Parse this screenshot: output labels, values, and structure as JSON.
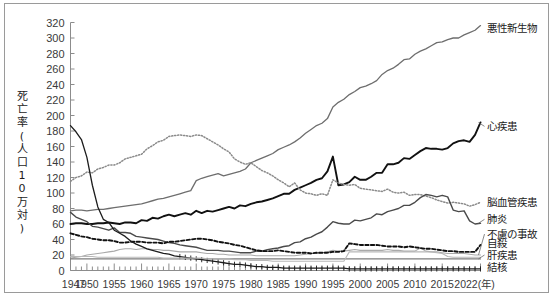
{
  "figure": {
    "y_axis_title": "死亡率(人口10万対)",
    "y_axis_title_chars": [
      "死",
      "亡",
      "率",
      "(",
      "人",
      "口",
      "1",
      "0",
      "万",
      "対",
      ")"
    ],
    "x_axis_unit_label": "2022(年)"
  },
  "chart_data": {
    "type": "line",
    "title": "",
    "xlabel": "年",
    "ylabel": "死亡率(人口10万対)",
    "xlim": [
      1947,
      2022
    ],
    "ylim": [
      0,
      320
    ],
    "ytick_step": 20,
    "grid": false,
    "legend_position": "right-inline-labels",
    "yticks": [
      0,
      20,
      40,
      60,
      80,
      100,
      120,
      140,
      160,
      180,
      200,
      220,
      240,
      260,
      280,
      300,
      320
    ],
    "xticks": [
      1947,
      1950,
      1955,
      1960,
      1965,
      1970,
      1975,
      1980,
      1985,
      1990,
      1995,
      2000,
      2005,
      2010,
      2015,
      2022
    ],
    "xtick_labels": [
      "1947",
      "1950",
      "1955",
      "1960",
      "1965",
      "1970",
      "1975",
      "1980",
      "1985",
      "1990",
      "1995",
      "2000",
      "2005",
      "2010",
      "2015",
      "2022(年)"
    ],
    "x": [
      1947,
      1948,
      1949,
      1950,
      1951,
      1952,
      1953,
      1954,
      1955,
      1956,
      1957,
      1958,
      1959,
      1960,
      1961,
      1962,
      1963,
      1964,
      1965,
      1966,
      1967,
      1968,
      1969,
      1970,
      1971,
      1972,
      1973,
      1974,
      1975,
      1976,
      1977,
      1978,
      1979,
      1980,
      1981,
      1982,
      1983,
      1984,
      1985,
      1986,
      1987,
      1988,
      1989,
      1990,
      1991,
      1992,
      1993,
      1994,
      1995,
      1996,
      1997,
      1998,
      1999,
      2000,
      2001,
      2002,
      2003,
      2004,
      2005,
      2006,
      2007,
      2008,
      2009,
      2010,
      2011,
      2012,
      2013,
      2014,
      2015,
      2016,
      2017,
      2018,
      2019,
      2020,
      2021,
      2022
    ],
    "series": [
      {
        "name": "悪性新生物",
        "label": "悪性新生物",
        "color": "#6e6e6e",
        "style": "solid",
        "width": 1.3,
        "label_xy": [
          2022,
          313
        ],
        "values": [
          77,
          78,
          78,
          77,
          78,
          79,
          79,
          80,
          81,
          82,
          83,
          84,
          85,
          86,
          88,
          90,
          92,
          93,
          95,
          97,
          99,
          101,
          103,
          116,
          119,
          121,
          123,
          125,
          122,
          124,
          126,
          128,
          131,
          139,
          142,
          145,
          148,
          151,
          156,
          159,
          162,
          166,
          171,
          177,
          182,
          187,
          190,
          196,
          211,
          217,
          221,
          227,
          231,
          236,
          238,
          241,
          245,
          253,
          258,
          261,
          266,
          272,
          273,
          279,
          283,
          286,
          290,
          294,
          295,
          298,
          300,
          300,
          304,
          307,
          310,
          316
        ]
      },
      {
        "name": "心疾患",
        "label": "心疾患",
        "color": "#111111",
        "style": "solid",
        "width": 1.9,
        "label_xy": [
          2022,
          186
        ],
        "values": [
          60,
          61,
          61,
          60,
          60,
          61,
          61,
          62,
          61,
          60,
          62,
          62,
          61,
          65,
          64,
          68,
          67,
          70,
          72,
          70,
          72,
          74,
          72,
          77,
          74,
          77,
          76,
          78,
          80,
          82,
          80,
          84,
          83,
          86,
          88,
          89,
          91,
          93,
          96,
          99,
          99,
          104,
          107,
          110,
          113,
          117,
          119,
          128,
          147,
          110,
          111,
          114,
          121,
          117,
          117,
          121,
          126,
          126,
          137,
          137,
          139,
          145,
          144,
          149,
          154,
          158,
          157,
          157,
          156,
          158,
          164,
          167,
          168,
          166,
          175,
          191
        ]
      },
      {
        "name": "脳血管疾患",
        "label": "脳血管疾患",
        "color": "#8a8a8a",
        "style": "dotted",
        "width": 1.5,
        "label_xy": [
          2022,
          88
        ],
        "values": [
          115,
          120,
          122,
          127,
          126,
          131,
          133,
          136,
          136,
          139,
          144,
          146,
          148,
          150,
          157,
          161,
          166,
          168,
          173,
          174,
          175,
          174,
          173,
          175,
          174,
          170,
          166,
          162,
          157,
          153,
          144,
          140,
          137,
          139,
          134,
          129,
          126,
          122,
          117,
          113,
          108,
          113,
          104,
          100,
          99,
          97,
          99,
          97,
          117,
          113,
          111,
          110,
          111,
          106,
          105,
          104,
          103,
          102,
          105,
          101,
          100,
          101,
          97,
          98,
          98,
          96,
          94,
          91,
          89,
          87,
          88,
          87,
          86,
          83,
          85,
          88
        ]
      },
      {
        "name": "肺炎",
        "label": "肺炎",
        "color": "#4a4a4a",
        "style": "solid",
        "width": 1.4,
        "label_xy": [
          2022,
          66
        ],
        "values": [
          75,
          69,
          66,
          63,
          57,
          56,
          54,
          52,
          55,
          49,
          49,
          48,
          44,
          43,
          42,
          41,
          40,
          38,
          36,
          35,
          33,
          32,
          31,
          30,
          28,
          26,
          26,
          26,
          25,
          25,
          24,
          23,
          23,
          23,
          25,
          25,
          27,
          28,
          29,
          31,
          32,
          36,
          37,
          41,
          43,
          47,
          50,
          56,
          63,
          61,
          60,
          60,
          65,
          64,
          66,
          68,
          73,
          72,
          76,
          78,
          80,
          84,
          84,
          88,
          94,
          98,
          97,
          95,
          97,
          95,
          78,
          76,
          77,
          64,
          60,
          61
        ]
      },
      {
        "name": "不慮の事故",
        "label": "不慮の事故",
        "color": "#a9a9a9",
        "style": "solid",
        "width": 1.1,
        "label_xy": [
          2022,
          47
        ],
        "values": [
          16,
          17,
          18,
          20,
          21,
          22,
          23,
          24,
          25,
          27,
          28,
          28,
          27,
          28,
          28,
          27,
          27,
          26,
          26,
          25,
          24,
          24,
          24,
          24,
          23,
          22,
          22,
          21,
          21,
          20,
          20,
          20,
          20,
          20,
          19,
          19,
          19,
          19,
          19,
          19,
          19,
          19,
          20,
          21,
          22,
          22,
          23,
          24,
          26,
          25,
          25,
          26,
          27,
          26,
          26,
          26,
          26,
          26,
          27,
          26,
          26,
          25,
          25,
          25,
          29,
          25,
          24,
          24,
          23,
          22,
          22,
          22,
          22,
          21,
          20,
          20
        ]
      },
      {
        "name": "自殺",
        "label": "自殺",
        "color": "#111111",
        "style": "dashed",
        "width": 1.9,
        "label_xy": [
          2022,
          35
        ],
        "values": [
          48,
          46,
          44,
          43,
          41,
          40,
          39,
          39,
          38,
          36,
          36,
          37,
          37,
          37,
          36,
          36,
          36,
          35,
          37,
          37,
          38,
          39,
          40,
          41,
          41,
          40,
          39,
          37,
          36,
          35,
          33,
          32,
          30,
          28,
          26,
          25,
          25,
          25,
          26,
          25,
          24,
          23,
          23,
          23,
          22,
          23,
          23,
          23,
          24,
          24,
          25,
          35,
          34,
          33,
          33,
          33,
          33,
          32,
          31,
          31,
          31,
          30,
          31,
          30,
          29,
          28,
          28,
          27,
          26,
          25,
          25,
          24,
          24,
          24,
          24,
          33
        ]
      },
      {
        "name": "肝疾患",
        "label": "肝疾患",
        "color": "#7d7d7d",
        "style": "solid",
        "width": 1.1,
        "label_xy": [
          2022,
          20
        ],
        "values": [
          15,
          15,
          15,
          15,
          15,
          15,
          15,
          15,
          15,
          15,
          15,
          15,
          15,
          15,
          15,
          15,
          15,
          15,
          15,
          15,
          15,
          15,
          15,
          15,
          15,
          15,
          15,
          15,
          15,
          15,
          15,
          15,
          15,
          15,
          15,
          15,
          15,
          15,
          15,
          15,
          15,
          15,
          15,
          15,
          15,
          15,
          15,
          15,
          15,
          15,
          15,
          15,
          15,
          15,
          15,
          15,
          15,
          15,
          15,
          15,
          15,
          15,
          15,
          15,
          15,
          15,
          15,
          15,
          15,
          15,
          15,
          15,
          15,
          15,
          15,
          15
        ]
      },
      {
        "name": "結核",
        "label": "結核",
        "color": "#1c1c1c",
        "style": "solid-with-ticks",
        "width": 1.3,
        "label_xy": [
          2022,
          5
        ],
        "values": [
          187,
          179,
          169,
          146,
          110,
          82,
          66,
          62,
          52,
          48,
          44,
          38,
          34,
          31,
          28,
          26,
          24,
          22,
          21,
          19,
          18,
          17,
          16,
          15,
          14,
          13,
          12,
          11,
          10,
          9,
          8,
          8,
          7,
          6,
          5,
          5,
          4,
          4,
          4,
          3,
          3,
          3,
          3,
          3,
          3,
          3,
          3,
          3,
          3,
          3,
          3,
          2,
          2,
          2,
          2,
          2,
          2,
          2,
          2,
          2,
          2,
          2,
          2,
          2,
          2,
          2,
          2,
          2,
          2,
          2,
          2,
          2,
          2,
          2,
          2,
          2
        ]
      },
      {
        "name": "老衰_補助",
        "label": "",
        "color": "#b8b8b8",
        "style": "solid",
        "width": 1.1,
        "label_xy": [
          2022,
          0
        ],
        "values": [
          18,
          18,
          18,
          18,
          18,
          17,
          17,
          17,
          17,
          17,
          17,
          17,
          17,
          17,
          17,
          17,
          17,
          16,
          16,
          16,
          16,
          16,
          16,
          16,
          16,
          15,
          15,
          15,
          15,
          15,
          14,
          14,
          14,
          13,
          13,
          13,
          13,
          12,
          12,
          12,
          12,
          12,
          12,
          12,
          12,
          12,
          12,
          12,
          12,
          12,
          12,
          24,
          24,
          24,
          24,
          24,
          24,
          24,
          24,
          24,
          24,
          24,
          24,
          24,
          24,
          24,
          24,
          23,
          22,
          18,
          17,
          17,
          17,
          17,
          17,
          17
        ]
      }
    ]
  }
}
